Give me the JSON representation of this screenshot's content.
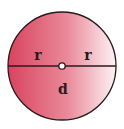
{
  "diagram": {
    "labels": {
      "radius_left": "r",
      "radius_right": "r",
      "diameter": "d"
    },
    "colors": {
      "fill_left": "#d9435e",
      "fill_right": "#ffffff",
      "stroke": "#2a1a1c"
    }
  }
}
